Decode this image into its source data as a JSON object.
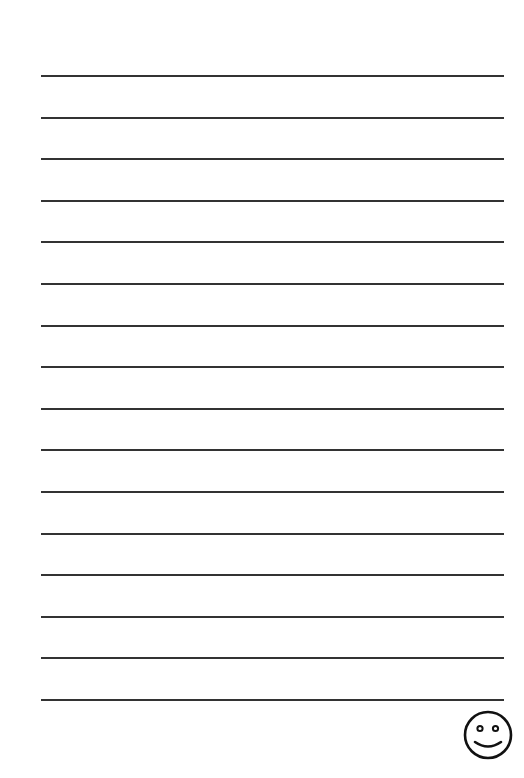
{
  "page": {
    "type": "lined-writing-paper",
    "background_color": "#ffffff",
    "line_color": "#333333",
    "line_count": 16,
    "line_left": 41,
    "line_right": 504,
    "first_line_y": 76,
    "line_spacing": 41.6
  },
  "decoration": {
    "icon": "smiley-face-icon",
    "stroke_color": "#111111"
  }
}
